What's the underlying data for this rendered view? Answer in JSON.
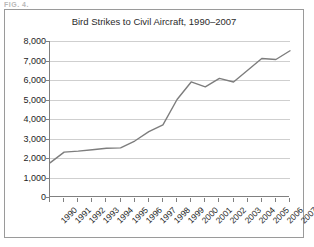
{
  "scan_header": "FIG. 4.",
  "chart_data": {
    "type": "line",
    "title": "Bird Strikes to Civil Aircraft, 1990–2007",
    "xlabel": "",
    "ylabel": "",
    "categories": [
      "1990",
      "1991",
      "1992",
      "1993",
      "1994",
      "1995",
      "1996",
      "1997",
      "1998",
      "1999",
      "2000",
      "2001",
      "2002",
      "2003",
      "2004",
      "2005",
      "2006",
      "2007"
    ],
    "values": [
      1750,
      2300,
      2350,
      2420,
      2500,
      2520,
      2870,
      3350,
      3700,
      5000,
      5900,
      5650,
      6080,
      5900,
      6500,
      7100,
      7050,
      7500
    ],
    "ylim": [
      0,
      8000
    ],
    "yticks": [
      0,
      1000,
      2000,
      3000,
      4000,
      5000,
      6000,
      7000,
      8000
    ],
    "ytick_labels": [
      "0",
      "1,000",
      "2,000",
      "3,000",
      "4,000",
      "5,000",
      "6,000",
      "7,000",
      "8,000"
    ],
    "grid": true,
    "legend": "none",
    "series": [
      {
        "name": "Bird strikes",
        "color": "#7d7d7d",
        "values": [
          1750,
          2300,
          2350,
          2420,
          2500,
          2520,
          2870,
          3350,
          3700,
          5000,
          5900,
          5650,
          6080,
          5900,
          6500,
          7100,
          7050,
          7500
        ]
      }
    ]
  },
  "colors": {
    "line": "#7d7d7d",
    "grid": "#cfcfcf",
    "axis": "#808080",
    "border": "#9a9a9a",
    "text": "#1d1d1d",
    "title": "#2b2b2b",
    "background": "#ffffff"
  }
}
